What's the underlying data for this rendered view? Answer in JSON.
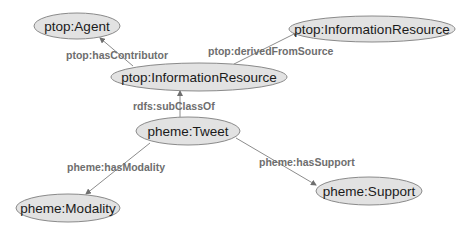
{
  "diagram": {
    "type": "ontology-graph",
    "nodes": [
      {
        "id": "agent",
        "label": "ptop:Agent",
        "cx": 77,
        "cy": 26,
        "rx": 43,
        "ry": 13
      },
      {
        "id": "info_center",
        "label": "ptop:InformationResource",
        "cx": 199,
        "cy": 77,
        "rx": 88,
        "ry": 14
      },
      {
        "id": "info_right",
        "label": "ptop:InformationResource",
        "cx": 372,
        "cy": 29,
        "rx": 83,
        "ry": 13
      },
      {
        "id": "tweet",
        "label": "pheme:Tweet",
        "cx": 188,
        "cy": 131,
        "rx": 52,
        "ry": 14
      },
      {
        "id": "modality",
        "label": "pheme:Modality",
        "cx": 68,
        "cy": 208,
        "rx": 52,
        "ry": 14
      },
      {
        "id": "support",
        "label": "pheme:Support",
        "cx": 369,
        "cy": 191,
        "rx": 53,
        "ry": 14
      }
    ],
    "edges": [
      {
        "id": "hasContributor",
        "label": "ptop:hasContributor",
        "from": "info_center",
        "to": "agent",
        "x1": 133,
        "y1": 66,
        "x2": 100,
        "y2": 38,
        "lx": 66,
        "ly": 55
      },
      {
        "id": "derivedFromSource",
        "label": "ptop:derivedFromSource",
        "from": "info_center",
        "to": "info_right",
        "x1": 234,
        "y1": 64,
        "x2": 298,
        "y2": 32,
        "lx": 208,
        "ly": 51
      },
      {
        "id": "subClassOf",
        "label": "rdfs:subClassOf",
        "from": "tweet",
        "to": "info_center",
        "x1": 180,
        "y1": 117,
        "x2": 180,
        "y2": 91,
        "lx": 133,
        "ly": 106
      },
      {
        "id": "hasModality",
        "label": "pheme:hasModality",
        "from": "tweet",
        "to": "modality",
        "x1": 150,
        "y1": 143,
        "x2": 86,
        "y2": 194,
        "lx": 67,
        "ly": 167
      },
      {
        "id": "hasSupport",
        "label": "pheme:hasSupport",
        "from": "tweet",
        "to": "support",
        "x1": 236,
        "y1": 138,
        "x2": 316,
        "y2": 185,
        "lx": 259,
        "ly": 162
      }
    ]
  },
  "colors": {
    "node_fill": "#e2e2e2",
    "node_stroke": "#8a8a8a",
    "node_text": "#1a1a1a",
    "edge_line": "#8c8c8c",
    "edge_text": "#6e6e6e"
  }
}
